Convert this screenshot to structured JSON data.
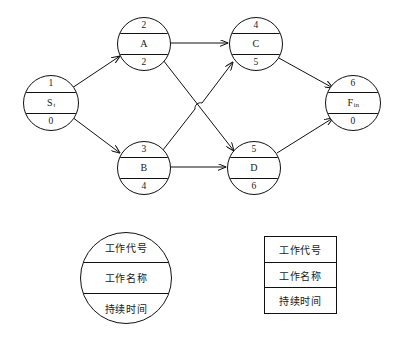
{
  "diagram": {
    "type": "activity-on-node-network",
    "nodes": [
      {
        "id": "start",
        "code": "1",
        "name": "S",
        "name_sub": "t",
        "duration": "0",
        "cx": 50,
        "cy": 102,
        "r": 27
      },
      {
        "id": "A",
        "code": "2",
        "name": "A",
        "name_sub": "",
        "duration": "2",
        "cx": 143,
        "cy": 43,
        "r": 26
      },
      {
        "id": "C",
        "code": "4",
        "name": "C",
        "name_sub": "",
        "duration": "5",
        "cx": 255,
        "cy": 43,
        "r": 26
      },
      {
        "id": "B",
        "code": "3",
        "name": "B",
        "name_sub": "",
        "duration": "4",
        "cx": 143,
        "cy": 167,
        "r": 26
      },
      {
        "id": "D",
        "code": "5",
        "name": "D",
        "name_sub": "",
        "duration": "6",
        "cx": 253,
        "cy": 167,
        "r": 26
      },
      {
        "id": "finish",
        "code": "6",
        "name": "F",
        "name_sub": "in",
        "duration": "0",
        "cx": 352,
        "cy": 102,
        "r": 27
      }
    ],
    "edges": [
      {
        "from": "start",
        "to": "A"
      },
      {
        "from": "start",
        "to": "B"
      },
      {
        "from": "A",
        "to": "C"
      },
      {
        "from": "A",
        "to": "D"
      },
      {
        "from": "B",
        "to": "C"
      },
      {
        "from": "B",
        "to": "D"
      },
      {
        "from": "C",
        "to": "finish"
      },
      {
        "from": "D",
        "to": "finish"
      }
    ]
  },
  "legend_circle": {
    "code_label": "工作代号",
    "name_label": "工作名称",
    "duration_label": "持续时间"
  },
  "legend_rect": {
    "code_label": "工作代号",
    "name_label": "工作名称",
    "duration_label": "持续时间"
  },
  "colors": {
    "stroke": "#111111",
    "background": "#ffffff",
    "text": "#1a1a1a"
  }
}
